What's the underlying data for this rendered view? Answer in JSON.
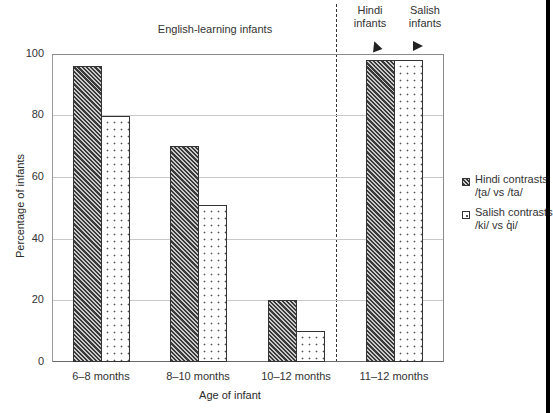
{
  "chart_data": {
    "type": "bar",
    "title": "",
    "xlabel": "Age of infant",
    "ylabel": "Percentage of infants",
    "ylim": [
      0,
      100
    ],
    "yticks": [
      "0",
      "20",
      "40",
      "60",
      "80",
      "100"
    ],
    "grid": true,
    "categories": [
      "6–8 months",
      "8–10 months",
      "10–12 months",
      "11–12 months"
    ],
    "series": [
      {
        "name": "Hindi contrasts /ʈa/ vs /ta/",
        "pattern": "diagonal-hatch",
        "values": [
          96,
          70,
          20,
          98
        ]
      },
      {
        "name": "Salish contrasts /ki/ vs q̓i/",
        "pattern": "dots",
        "values": [
          80,
          51,
          10,
          98
        ]
      }
    ],
    "legend_position": "right",
    "annotations": {
      "left_group": "English-learning infants",
      "right_group_hindi": "Hindi infants",
      "right_group_salish": "Salish infants"
    }
  },
  "labels": {
    "english_group": "English-learning infants",
    "hindi_infants_line1": "Hindi",
    "hindi_infants_line2": "infants",
    "salish_infants_line1": "Salish",
    "salish_infants_line2": "infants",
    "xlabel": "Age of infant",
    "ylabel": "Percentage of infants",
    "yticks": [
      "0",
      "20",
      "40",
      "60",
      "80",
      "100"
    ],
    "categories": [
      "6–8 months",
      "8–10 months",
      "10–12 months",
      "11–12 months"
    ]
  },
  "legend": {
    "hindi_line1": "Hindi contrasts",
    "hindi_line2": "/ʈa/ vs /ta/",
    "salish_line1": "Salish contrasts",
    "salish_line2": "/ki/ vs q̓i/"
  },
  "colors": {
    "hatch_dark": "#3a3a3a",
    "hatch_light": "#c9c9c9",
    "dot": "#555555",
    "axis": "#6a6a6a",
    "grid": "#c8c8c8"
  }
}
